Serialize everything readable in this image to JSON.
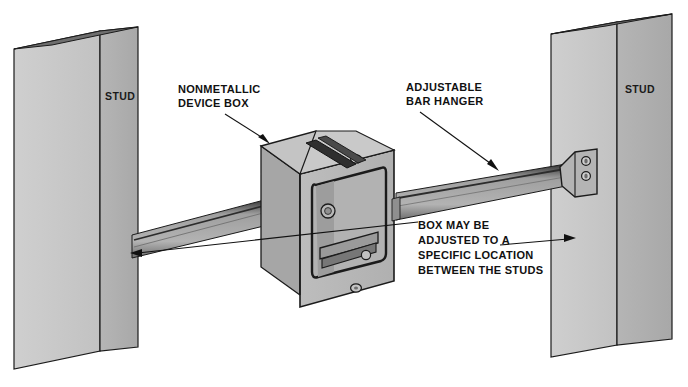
{
  "figure": {
    "background_color": "#ffffff",
    "width": 688,
    "height": 387
  },
  "palette": {
    "stud_face_light": "#c9c9c9",
    "stud_face_shadow": "#b0b0b0",
    "stud_edge_dark": "#6e6e6e",
    "box_front": "#b9b9b9",
    "box_top": "#c4c4c4",
    "box_side": "#a6a6a6",
    "box_interior": "#b2b2b2",
    "bar_face": "#a8a8a8",
    "bar_dark": "#3a3a3a",
    "outline": "#1b1b1b",
    "text": "#111111"
  },
  "labels": [
    {
      "id": "stud-left",
      "text": "STUD",
      "x": 105,
      "y": 100
    },
    {
      "id": "stud-right",
      "text": "STUD",
      "x": 640,
      "y": 93
    }
  ],
  "callouts": [
    {
      "id": "nonmetallic-device-box",
      "lines": [
        "NONMETALLIC",
        "DEVICE BOX"
      ],
      "text_x": 178,
      "text_y": 93,
      "leader_from": [
        225,
        112
      ],
      "leader_to": [
        268,
        140
      ]
    },
    {
      "id": "adjustable-bar-hanger",
      "lines": [
        "ADJUSTABLE",
        "BAR HANGER"
      ],
      "text_x": 406,
      "text_y": 91,
      "leader_from": [
        420,
        110
      ],
      "leader_to": [
        497,
        168
      ]
    },
    {
      "id": "adjustment-note",
      "lines": [
        "BOX MAY BE",
        "ADJUSTED TO A",
        "SPECIFIC LOCATION",
        "BETWEEN THE STUDS"
      ],
      "text_x": 418,
      "text_y": 229,
      "leader_left_arrow_to": [
        132,
        253
      ],
      "leader_right_arrow_to": [
        574,
        239
      ]
    }
  ],
  "components": {
    "stud_left": {
      "name": "STUD",
      "faces": [
        "front",
        "right-side"
      ],
      "label_face": "right-side"
    },
    "stud_right": {
      "name": "STUD",
      "faces": [
        "front",
        "right-side"
      ],
      "label_face": "right-side"
    },
    "device_box": {
      "name": "NONMETALLIC DEVICE BOX",
      "shape": "single-gang rectangular box",
      "features": [
        "mounting screw boss",
        "internal clamp bar",
        "strap over top"
      ]
    },
    "bar_hanger": {
      "name": "ADJUSTABLE BAR HANGER",
      "features": [
        "telescoping channel bar",
        "L-bracket end flange",
        "two mounting screws"
      ],
      "screw_count": 2
    }
  }
}
